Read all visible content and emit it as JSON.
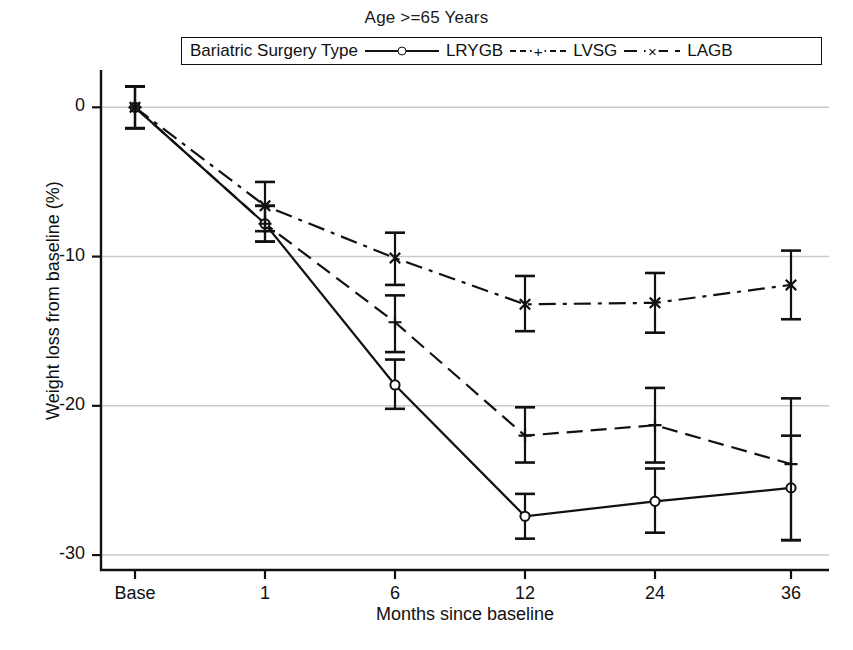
{
  "figure": {
    "title": "Age >=65 Years",
    "xlabel": "Months since baseline",
    "ylabel": "Weight loss from baseline (%)",
    "caption": ""
  },
  "legend": {
    "title": "Bariatric Surgery Type",
    "entries": [
      {
        "label": "LRYGB",
        "marker": "circle",
        "line": "solid"
      },
      {
        "label": "LVSG",
        "marker": "plus",
        "line": "dashed"
      },
      {
        "label": "LAGB",
        "marker": "x",
        "line": "dash-dot"
      }
    ]
  },
  "axes": {
    "y_ticks": [
      "0",
      "-10",
      "-20",
      "-30"
    ],
    "x_ticks": [
      "Base",
      "1",
      "6",
      "12",
      "24",
      "36"
    ]
  },
  "colors": {
    "line": "#111111",
    "grid": "#c9c9c9",
    "axis": "#111111",
    "background": "#ffffff"
  },
  "chart_data": {
    "type": "line",
    "title": "Age >=65 Years",
    "xlabel": "Months since baseline",
    "ylabel": "Weight loss from baseline (%)",
    "categories": [
      "Base",
      "1",
      "6",
      "12",
      "24",
      "36"
    ],
    "x": [
      0,
      1,
      6,
      12,
      24,
      36
    ],
    "ylim": [
      -31,
      2.5
    ],
    "y_ticks": [
      0,
      -10,
      -20,
      -30
    ],
    "grid": "horizontal",
    "legend_position": "top",
    "error_bars": true,
    "series": [
      {
        "name": "LRYGB",
        "marker": "circle",
        "line": "solid",
        "values": [
          0.0,
          -7.8,
          -18.6,
          -27.4,
          -26.4,
          -25.5
        ],
        "err_low": [
          -1.4,
          -9.0,
          -20.2,
          -28.9,
          -28.5,
          -29.0
        ],
        "err_high": [
          1.4,
          -6.6,
          -16.9,
          -25.9,
          -24.2,
          -22.0
        ]
      },
      {
        "name": "LVSG",
        "marker": "plus",
        "line": "dashed",
        "values": [
          0.0,
          -7.8,
          -14.4,
          -22.0,
          -21.3,
          -23.9
        ],
        "err_low": [
          -1.4,
          -9.0,
          -16.4,
          -23.8,
          -23.8,
          -29.0
        ],
        "err_high": [
          1.4,
          -6.6,
          -12.6,
          -20.1,
          -18.8,
          -19.5
        ]
      },
      {
        "name": "LAGB",
        "marker": "x",
        "line": "dash-dot",
        "values": [
          0.0,
          -6.6,
          -10.1,
          -13.2,
          -13.1,
          -11.9
        ],
        "err_low": [
          -1.4,
          -8.3,
          -11.9,
          -15.0,
          -15.1,
          -14.2
        ],
        "err_high": [
          1.4,
          -5.0,
          -8.4,
          -11.3,
          -11.1,
          -9.6
        ]
      }
    ]
  }
}
